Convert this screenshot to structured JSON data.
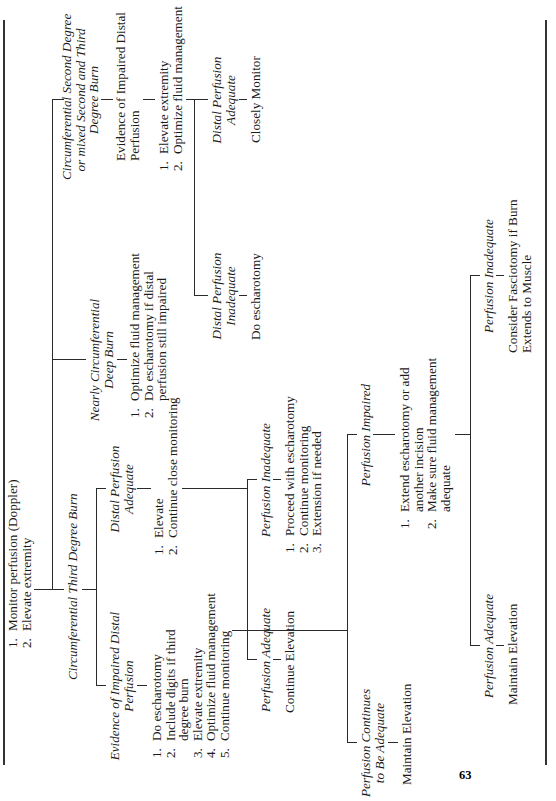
{
  "page_number": "63",
  "root": {
    "steps": [
      "Monitor perfusion (Doppler)",
      "Elevate extremity"
    ]
  },
  "branches": {
    "third_degree": {
      "title": "Circumferential Third Degree Burn",
      "impaired": {
        "title_line1": "Evidence of Impaired Distal",
        "title_line2": "Perfusion",
        "steps": [
          "Do escharotomy",
          "Include digits if third",
          "degree burn",
          "Elevate extremity",
          "Optimize fluid management",
          "Continue monitoring"
        ],
        "step_numbers": [
          "1.",
          "2.",
          "",
          "3.",
          "4.",
          "5."
        ],
        "continues": {
          "title_line1": "Perfusion Continues",
          "title_line2": "to Be Adequate",
          "action": "Maintain Elevation"
        },
        "perf_impaired": {
          "title": "Perfusion Impaired",
          "steps": [
            "Extend escharotomy or add",
            "another incision",
            "Make sure fluid management",
            "adequate"
          ],
          "step_numbers": [
            "1.",
            "",
            "2.",
            ""
          ],
          "adequate": {
            "title": "Perfusion Adequate",
            "action": "Maintain Elevation"
          },
          "inadequate": {
            "title": "Perfusion Inadequate",
            "action_line1": "Consider Fasciotomy if Burn",
            "action_line2": "Extends to Muscle"
          }
        }
      },
      "adequate": {
        "title_line1": "Distal Perfusion",
        "title_line2": "Adequate",
        "steps": [
          "Elevate",
          "Continue close monitoring"
        ],
        "perf_adequate": {
          "title": "Perfusion Adequate",
          "action": "Continue Elevation"
        },
        "perf_inadequate": {
          "title": "Perfusion Inadequate",
          "steps": [
            "Proceed with escharotomy",
            "Continue monitoring",
            "Extension if needed"
          ]
        }
      }
    },
    "nearly": {
      "title_line1": "Nearly Circumferential",
      "title_line2": "Deep Burn",
      "steps": [
        "Optimize fluid management",
        "Do escharotomy if distal",
        "perfusion still impaired"
      ],
      "step_numbers": [
        "1.",
        "2.",
        ""
      ]
    },
    "mixed": {
      "title_line1": "Circumferential Second Degree",
      "title_line2": "or mixed Second and Third",
      "title_line3": "Degree Burn",
      "evidence_line1": "Evidence of Impaired Distal",
      "evidence_line2": "Perfusion",
      "steps": [
        "Elevate extremity",
        "Optimize fluid management"
      ],
      "inadequate": {
        "title_line1": "Distal Perfusion",
        "title_line2": "Inadequate",
        "action": "Do escharotomy"
      },
      "adequate": {
        "title_line1": "Distal Perfusion",
        "title_line2": "Adequate",
        "action": "Closely Monitor"
      }
    }
  }
}
